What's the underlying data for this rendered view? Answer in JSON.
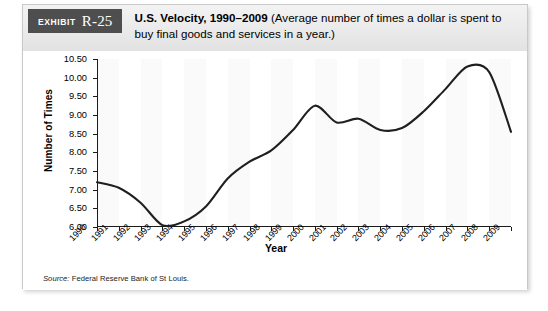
{
  "exhibit": {
    "badge_word": "Exhibit",
    "badge_number": "R-25",
    "title_bold": "U.S. Velocity, 1990–2009",
    "title_rest": " (Average number of times a dollar is spent to buy final goods and services in a year.)"
  },
  "source": {
    "lead": "Source:",
    "text": " Federal Reserve Bank of St Louis."
  },
  "colors": {
    "badge_background": "#4e4e4e",
    "header_background": "#eaeaea",
    "line": "#1f1f1f",
    "band": "#fafafa",
    "axis": "#1a1a1a",
    "frame": "#c9c9c9"
  },
  "chart_data": {
    "type": "line",
    "title": "U.S. Velocity, 1990–2009",
    "xlabel": "Year",
    "ylabel": "Number of Times",
    "ylim": [
      6.0,
      10.5
    ],
    "yticks": [
      "6.00",
      "6.50",
      "7.00",
      "7.50",
      "8.00",
      "8.50",
      "9.00",
      "9.50",
      "10.00",
      "10.50"
    ],
    "ytick_values": [
      6.0,
      6.5,
      7.0,
      7.5,
      8.0,
      8.5,
      9.0,
      9.5,
      10.0,
      10.5
    ],
    "grid": false,
    "legend": "none",
    "categories": [
      "1990",
      "1991",
      "1992",
      "1993",
      "1994",
      "1995",
      "1996",
      "1997",
      "1998",
      "1999",
      "2000",
      "2001",
      "2002",
      "2003",
      "2004",
      "2005",
      "2006",
      "2007",
      "2008",
      "2009"
    ],
    "values": [
      7.2,
      7.05,
      6.65,
      6.05,
      6.15,
      6.55,
      7.3,
      7.75,
      8.05,
      8.6,
      9.25,
      8.8,
      8.9,
      8.6,
      8.65,
      9.1,
      9.7,
      10.3,
      10.15,
      8.55
    ]
  }
}
